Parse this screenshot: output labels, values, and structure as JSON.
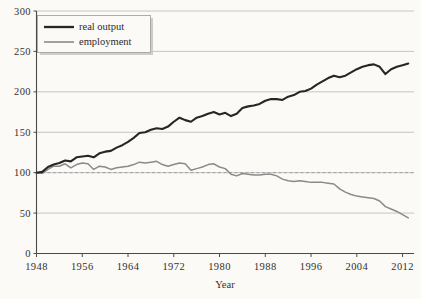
{
  "chart_data": {
    "type": "line",
    "title": "",
    "xlabel": "Year",
    "ylabel": "",
    "xlim": [
      1948,
      2014
    ],
    "ylim": [
      0,
      300
    ],
    "xticks": [
      1948,
      1956,
      1964,
      1972,
      1980,
      1988,
      1996,
      2004,
      2012
    ],
    "yticks": [
      0,
      50,
      100,
      150,
      200,
      250,
      300
    ],
    "grid": true,
    "legend_position": "top-left",
    "reference_line": {
      "y": 100,
      "style": "dashed"
    },
    "legend": [
      "real output",
      "employment"
    ],
    "series": [
      {
        "name": "real output",
        "color": "#262626",
        "x": [
          1948,
          1949,
          1950,
          1951,
          1952,
          1953,
          1954,
          1955,
          1956,
          1957,
          1958,
          1959,
          1960,
          1961,
          1962,
          1963,
          1964,
          1965,
          1966,
          1967,
          1968,
          1969,
          1970,
          1971,
          1972,
          1973,
          1974,
          1975,
          1976,
          1977,
          1978,
          1979,
          1980,
          1981,
          1982,
          1983,
          1984,
          1985,
          1986,
          1987,
          1988,
          1989,
          1990,
          1991,
          1992,
          1993,
          1994,
          1995,
          1996,
          1997,
          1998,
          1999,
          2000,
          2001,
          2002,
          2003,
          2004,
          2005,
          2006,
          2007,
          2008,
          2009,
          2010,
          2011,
          2012,
          2013
        ],
        "y": [
          100,
          102,
          113,
          118,
          121,
          127,
          123,
          134,
          136,
          139,
          135,
          146,
          150,
          151,
          162,
          170,
          178,
          190,
          204,
          206,
          214,
          219,
          217,
          226,
          240,
          253,
          245,
          238,
          251,
          258,
          266,
          271,
          262,
          270,
          258,
          268,
          288,
          294,
          298,
          303,
          314,
          322,
          321,
          318,
          330,
          336,
          349,
          352,
          363,
          378,
          391,
          404,
          415,
          409,
          415,
          428,
          441,
          452,
          459,
          462,
          452,
          424,
          442,
          452,
          460,
          466
        ],
        "y_index": [
          100,
          101,
          107,
          110,
          112,
          115,
          114,
          119,
          120,
          121,
          119,
          124,
          126,
          127,
          131,
          134,
          138,
          143,
          149,
          150,
          153,
          155,
          154,
          157,
          163,
          168,
          165,
          163,
          168,
          170,
          173,
          175,
          172,
          174,
          170,
          173,
          180,
          182,
          183,
          185,
          189,
          191,
          191,
          190,
          194,
          196,
          200,
          201,
          204,
          209,
          213,
          217,
          220,
          218,
          220,
          224,
          228,
          231,
          233,
          234,
          231,
          222,
          228,
          231,
          233,
          235
        ]
      },
      {
        "name": "employment",
        "color": "#8a8a8a",
        "x": [
          1948,
          1949,
          1950,
          1951,
          1952,
          1953,
          1954,
          1955,
          1956,
          1957,
          1958,
          1959,
          1960,
          1961,
          1962,
          1963,
          1964,
          1965,
          1966,
          1967,
          1968,
          1969,
          1970,
          1971,
          1972,
          1973,
          1974,
          1975,
          1976,
          1977,
          1978,
          1979,
          1980,
          1981,
          1982,
          1983,
          1984,
          1985,
          1986,
          1987,
          1988,
          1989,
          1990,
          1991,
          1992,
          1993,
          1994,
          1995,
          1996,
          1997,
          1998,
          1999,
          2000,
          2001,
          2002,
          2003,
          2004,
          2005,
          2006,
          2007,
          2008,
          2009,
          2010,
          2011,
          2012,
          2013
        ],
        "y_index": [
          100,
          99,
          104,
          108,
          108,
          111,
          106,
          110,
          112,
          111,
          104,
          108,
          107,
          104,
          106,
          107,
          108,
          110,
          113,
          112,
          113,
          114,
          110,
          108,
          110,
          112,
          111,
          103,
          105,
          107,
          110,
          111,
          107,
          105,
          98,
          96,
          99,
          98,
          97,
          97,
          98,
          98,
          96,
          92,
          90,
          89,
          90,
          89,
          88,
          88,
          88,
          87,
          86,
          80,
          76,
          73,
          71,
          70,
          69,
          68,
          65,
          58,
          55,
          52,
          48,
          44
        ]
      }
    ]
  },
  "legend": {
    "items": [
      {
        "label": "real output"
      },
      {
        "label": "employment"
      }
    ]
  },
  "axes": {
    "x_label": "Year",
    "y_ticks": [
      "0",
      "50",
      "100",
      "150",
      "200",
      "250",
      "300"
    ],
    "x_ticks": [
      "1948",
      "1956",
      "1964",
      "1972",
      "1980",
      "1988",
      "1996",
      "2004",
      "2012"
    ]
  },
  "colors": {
    "background": "#fbfaf7",
    "grid": "#b9b9b9",
    "axis": "#4a4a4a",
    "real_output": "#262626",
    "employment": "#8a8a8a",
    "reference": "#9a9a9a"
  }
}
